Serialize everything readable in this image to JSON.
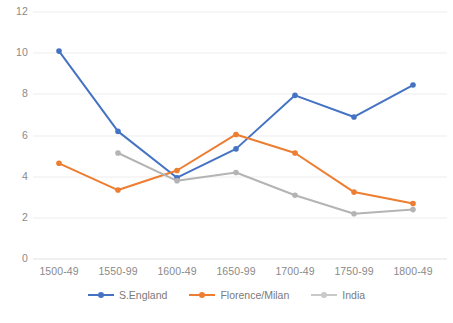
{
  "chart_data": {
    "type": "line",
    "title": "",
    "xlabel": "",
    "ylabel": "",
    "categories": [
      "1500-49",
      "1550-99",
      "1600-49",
      "1650-99",
      "1700-49",
      "1750-99",
      "1800-49"
    ],
    "series": [
      {
        "name": "S.England",
        "color": "#4573c4",
        "values": [
          10.1,
          6.2,
          3.95,
          5.35,
          7.95,
          6.9,
          8.45
        ]
      },
      {
        "name": "Florence/Milan",
        "color": "#ed7d31",
        "values": [
          4.65,
          3.35,
          4.3,
          6.05,
          5.15,
          3.25,
          2.7
        ]
      },
      {
        "name": "India",
        "color": "#b4b4b4",
        "values": [
          null,
          5.15,
          3.8,
          4.2,
          3.1,
          2.2,
          2.4
        ]
      }
    ],
    "ylim": [
      0,
      12
    ],
    "yticks": [
      0,
      2,
      4,
      6,
      8,
      10,
      12
    ],
    "ytick_labels": [
      "0",
      "2",
      "4",
      "6",
      "8",
      "10",
      "12"
    ],
    "grid": true,
    "grid_color": "#ededed",
    "legend_position": "bottom",
    "marker": "circle"
  },
  "yticks": {
    "t0": "0",
    "t1": "2",
    "t2": "4",
    "t3": "6",
    "t4": "8",
    "t5": "10",
    "t6": "12"
  },
  "xticks": {
    "t0": "1500-49",
    "t1": "1550-99",
    "t2": "1600-49",
    "t3": "1650-99",
    "t4": "1700-49",
    "t5": "1750-99",
    "t6": "1800-49"
  },
  "legend": {
    "items": [
      {
        "label": "S.England",
        "color": "#4573c4"
      },
      {
        "label": "Florence/Milan",
        "color": "#ed7d31"
      },
      {
        "label": "India",
        "color": "#b4b4b4"
      }
    ]
  }
}
